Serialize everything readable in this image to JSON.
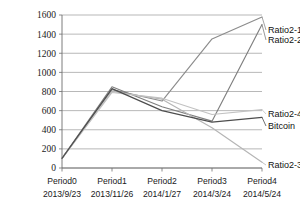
{
  "chart_data": {
    "type": "line",
    "title": "",
    "xlabel": "",
    "ylabel": "",
    "ylim": [
      0,
      1600
    ],
    "y_ticks": [
      0,
      200,
      400,
      600,
      800,
      1000,
      1200,
      1400,
      1600
    ],
    "y_tick_labels": [
      "0",
      "200",
      "400",
      "600",
      "800",
      "1000",
      "1200",
      "1400",
      "1600"
    ],
    "grid": true,
    "legend_position": "right-inline-labels",
    "categories": [
      "Period0",
      "Period1",
      "Period2",
      "Period3",
      "Period4"
    ],
    "category_dates": [
      "2013/9/23",
      "2013/11/26",
      "2014/1/27",
      "2014/3/24",
      "2014/5/24"
    ],
    "series": [
      {
        "name": "Ratio2-1",
        "color": "#8c8c8c",
        "values": [
          100,
          820,
          700,
          1350,
          1580
        ]
      },
      {
        "name": "Ratio2-2",
        "color": "#7f7f7f",
        "values": [
          100,
          850,
          640,
          490,
          1500
        ]
      },
      {
        "name": "Ratio2-3",
        "color": "#b5b5b5",
        "values": [
          100,
          800,
          720,
          420,
          60
        ]
      },
      {
        "name": "Ratio2-4",
        "color": "#c2c2c2",
        "values": [
          100,
          790,
          730,
          560,
          610
        ]
      },
      {
        "name": "Bitcoin",
        "color": "#4d4d4d",
        "values": [
          100,
          830,
          600,
          480,
          530
        ]
      }
    ],
    "legend_labels": [
      {
        "label": "Ratio2-1",
        "color": "#8c8c8c"
      },
      {
        "label": "Ratio2-2",
        "color": "#7f7f7f"
      },
      {
        "label": "Ratio2-4",
        "color": "#c2c2c2"
      },
      {
        "label": "Bitcoin",
        "color": "#4d4d4d"
      },
      {
        "label": "Ratio2-3",
        "color": "#b5b5b5"
      }
    ]
  }
}
